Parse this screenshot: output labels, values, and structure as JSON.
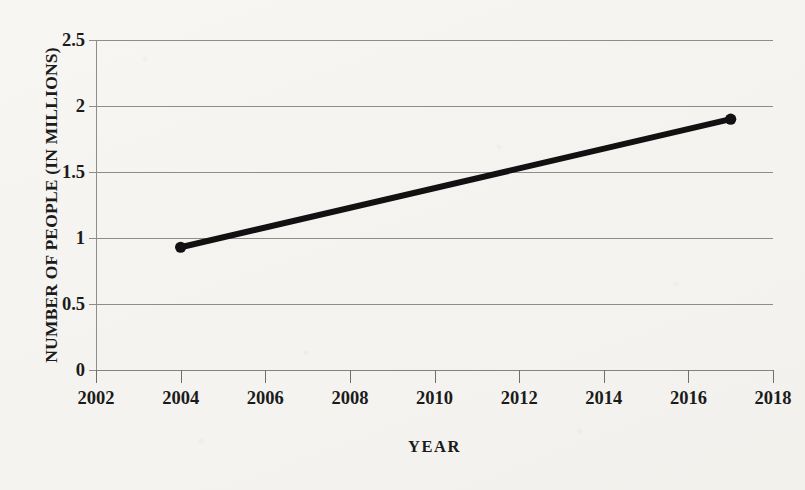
{
  "chart_data": {
    "type": "line",
    "title": "",
    "xlabel": "YEAR",
    "ylabel": "NUMBER OF PEOPLE (IN MILLIONS)",
    "xlim": [
      2002,
      2018
    ],
    "ylim": [
      0,
      2.5
    ],
    "xticks": [
      2002,
      2004,
      2006,
      2008,
      2010,
      2012,
      2014,
      2016,
      2018
    ],
    "xtick_labels": [
      "2002",
      "2004",
      "2006",
      "2008",
      "2010",
      "2012",
      "2014",
      "2016",
      "2018"
    ],
    "yticks": [
      0,
      0.5,
      1,
      1.5,
      2,
      2.5
    ],
    "ytick_labels": [
      "0",
      "0.5",
      "1",
      "1.5",
      "2",
      "2.5"
    ],
    "grid": "horizontal",
    "legend": "none",
    "series": [
      {
        "name": "Number of people",
        "color": "#111111",
        "marker": "circle",
        "line_width": 6,
        "x": [
          2004,
          2017
        ],
        "y": [
          0.93,
          1.9
        ],
        "points": [
          {
            "x": 2004,
            "y": 0.93
          },
          {
            "x": 2017,
            "y": 1.9
          }
        ]
      }
    ]
  },
  "colors": {
    "background": "#f4f3ef",
    "ink": "#1b1b1b",
    "gridline": "#8d8d8a",
    "series": "#111111"
  }
}
